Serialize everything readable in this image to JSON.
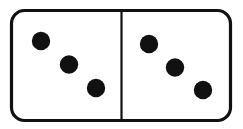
{
  "image": {
    "width": 243,
    "height": 129,
    "background_color": "#ffffff",
    "subject": "domino-tile",
    "alt_text": "A domino tile showing three pips on the left half and three pips on the right half"
  },
  "domino": {
    "name": "double-three",
    "total_pips": 6,
    "tile_label": "3 | 3",
    "ink_color": "#111111",
    "face_color": "#ffffff",
    "body": {
      "x": 11.5,
      "y": 10.5,
      "width": 219,
      "height": 110,
      "corner_radius": 13,
      "stroke_width": 3.2
    },
    "divider": {
      "x": 121.5,
      "y_top": 10.5,
      "y_bottom": 120.5,
      "stroke_width": 2.2
    },
    "pip_radius": 9.2,
    "halves": [
      {
        "side": "left",
        "pip_count": 3,
        "count_label": "3",
        "pips": [
          {
            "cx": 41,
            "cy": 41
          },
          {
            "cx": 69,
            "cy": 64.5
          },
          {
            "cx": 96,
            "cy": 88
          }
        ]
      },
      {
        "side": "right",
        "pip_count": 3,
        "count_label": "3",
        "pips": [
          {
            "cx": 149,
            "cy": 44
          },
          {
            "cx": 175,
            "cy": 67.5
          },
          {
            "cx": 203,
            "cy": 90
          }
        ]
      }
    ]
  }
}
